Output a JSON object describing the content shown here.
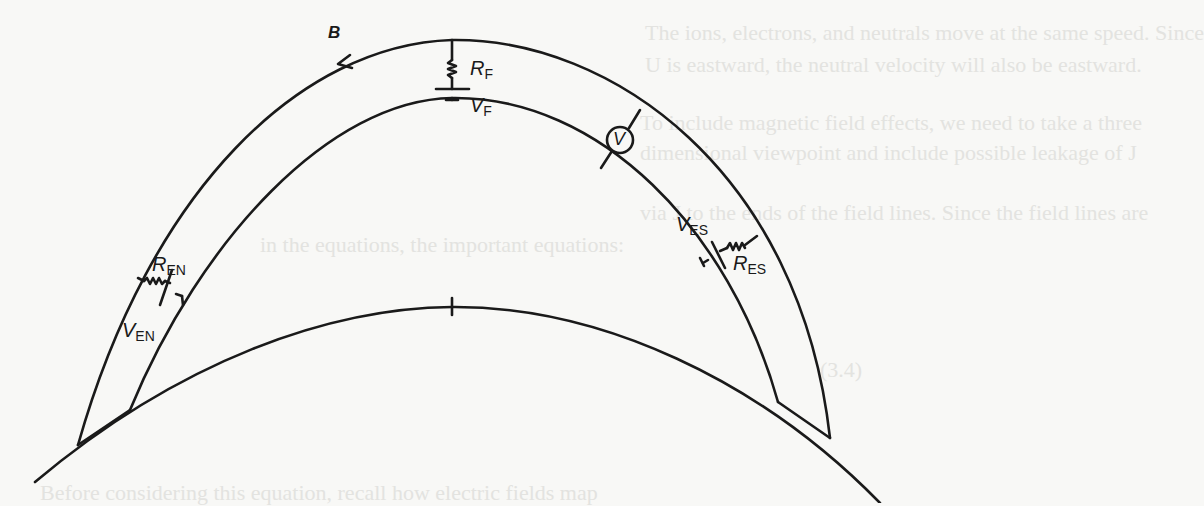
{
  "diagram": {
    "type": "field-line circuit schematic",
    "field_label": "B",
    "labels": {
      "rf": {
        "main": "R",
        "sub": "F"
      },
      "vf": {
        "main": "V",
        "sub": "F"
      },
      "voltmeter": "V",
      "ren": {
        "main": "R",
        "sub": "EN"
      },
      "ven": {
        "main": "V",
        "sub": "EN"
      },
      "ves": {
        "main": "V",
        "sub": "ES"
      },
      "res": {
        "main": "R",
        "sub": "ES"
      }
    },
    "stroke_color": "#1a1a1a",
    "background_color": "#f8f8f6"
  },
  "bleed_through": [
    "The ions, electrons, and neutrals move at the same speed. Since",
    "U is eastward, the neutral velocity will also be eastward.",
    "To include magnetic field effects, we need to take a three",
    "dimensional viewpoint and include possible leakage of J",
    "via J to the ends of the field lines. Since the field lines are",
    "in the equations, the important equations:",
    "(3.4)",
    "Before considering this equation, recall how electric fields map"
  ]
}
